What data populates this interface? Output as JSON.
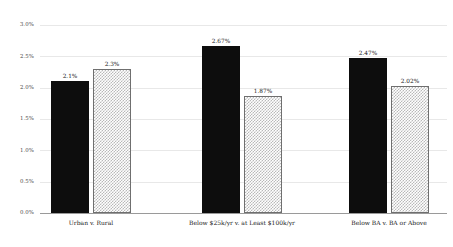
{
  "chart_data": {
    "type": "bar",
    "title": "",
    "subtitle": "",
    "xlabel": "",
    "ylabel": "",
    "ylim": [
      0,
      3.0
    ],
    "grid": true,
    "legend": "none",
    "value_suffix": "%",
    "categories": [
      "Urban v. Rural",
      "Below $25k/yr v. at Least $100k/yr",
      "Below BA v. BA or Above"
    ],
    "ytick_labels": [
      "0.0%",
      "0.5%",
      "1.0%",
      "1.5%",
      "2.0%",
      "2.5%",
      "3.0%"
    ],
    "ytick_values": [
      0.0,
      0.5,
      1.0,
      1.5,
      2.0,
      2.5,
      3.0
    ],
    "series": [
      {
        "name": "first",
        "style": "solid-black",
        "color": "#0d0d0d",
        "values": [
          2.1,
          2.67,
          2.47
        ],
        "labels": [
          "2.1%",
          "2.67%",
          "2.47%"
        ]
      },
      {
        "name": "second",
        "style": "checkered-light",
        "color": "#b9b9b9",
        "values": [
          2.3,
          1.87,
          2.02
        ],
        "labels": [
          "2.3%",
          "1.87%",
          "2.02%"
        ]
      }
    ]
  }
}
